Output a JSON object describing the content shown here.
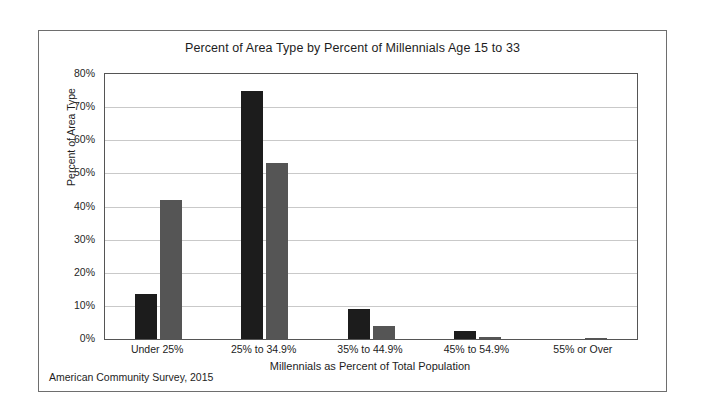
{
  "figure": {
    "source_note": "American Community Survey, 2015"
  },
  "chart_data": {
    "type": "bar",
    "title": "Percent of Area Type by Percent of Millennials Age 15 to 33",
    "xlabel": "Millennials as Percent of Total Population",
    "ylabel": "Percent of Area Type",
    "categories": [
      "Under 25%",
      "25% to 34.9%",
      "35% to 44.9%",
      "45% to 54.9%",
      "55% or Over"
    ],
    "series": [
      {
        "name": "Series 1",
        "color": "#1c1c1c",
        "values": [
          13.5,
          75.0,
          9.0,
          2.5,
          0.0
        ]
      },
      {
        "name": "Series 2",
        "color": "#555555",
        "values": [
          42.0,
          53.0,
          4.0,
          0.7,
          0.4
        ]
      }
    ],
    "ylim": [
      0,
      80
    ],
    "ytick_values": [
      0,
      10,
      20,
      30,
      40,
      50,
      60,
      70,
      80
    ],
    "ytick_labels": [
      "0%",
      "10%",
      "20%",
      "30%",
      "40%",
      "50%",
      "60%",
      "70%",
      "80%"
    ],
    "grid": true,
    "legend": "none"
  }
}
